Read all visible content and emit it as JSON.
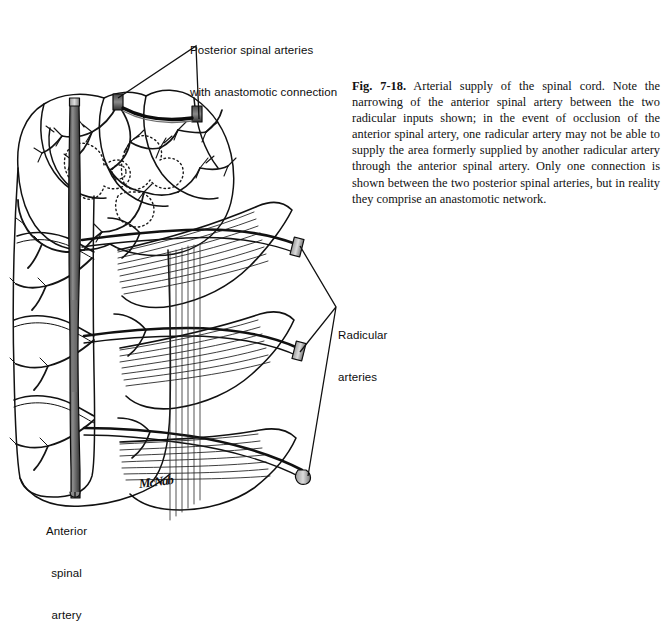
{
  "figure": {
    "number": "Fig. 7-18.",
    "caption": " Arterial supply of the spinal cord. Note the narrowing of the anterior spinal artery between the two radicular inputs shown; in the event of occlusion of the anterior spinal artery, one radicular artery may not be able to supply the area formerly supplied by another radicular artery through the anterior spinal artery. Only one connection is shown between the two posterior spinal arteries, but in reality they comprise an anastomotic network.",
    "signature": "McNab"
  },
  "labels": {
    "posterior_spinal_arteries": {
      "line1": "Posterior spinal arteries",
      "line2": "with anastomotic connection"
    },
    "radicular_arteries": {
      "line1": "Radicular",
      "line2": "arteries"
    },
    "anterior_spinal_artery": {
      "line1": "Anterior",
      "line2": "spinal",
      "line3": "artery"
    }
  },
  "illustration": {
    "title": "Pen-and-ink anatomical drawing of the spinal cord showing arterial supply",
    "subject": "spinal cord with anterior spinal artery, posterior spinal arteries and radicular arteries",
    "ink_color": "#111111",
    "artery_shading_color": "#6b6b6b",
    "page_background": "#ffffff"
  }
}
